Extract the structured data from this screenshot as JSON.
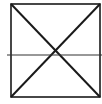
{
  "diagram": {
    "type": "geometric-figure",
    "stroke_color": "#1a1a1a",
    "background": "#ffffff",
    "square": {
      "x1": 11,
      "y1": 4,
      "x2": 100,
      "y2": 97
    },
    "horizontal_line": {
      "x1": 7,
      "x2": 102,
      "y": 55
    },
    "diagonals": [
      {
        "x1": 11,
        "y1": 4,
        "x2": 100,
        "y2": 97
      },
      {
        "x1": 100,
        "y1": 4,
        "x2": 11,
        "y2": 97
      }
    ]
  }
}
